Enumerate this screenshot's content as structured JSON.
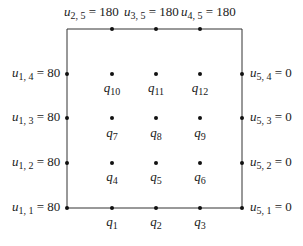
{
  "diagram": {
    "type": "finite-difference-grid",
    "colors": {
      "line": "#333333",
      "node": "#111111",
      "text": "#1a1a1a",
      "background": "#ffffff"
    },
    "boundary": {
      "top": [
        {
          "var": "u",
          "sub": "2, 5",
          "eq": " = 180"
        },
        {
          "var": "u",
          "sub": "3, 5",
          "eq": " = 180"
        },
        {
          "var": "u",
          "sub": "4, 5",
          "eq": " = 180"
        }
      ],
      "left": [
        {
          "var": "u",
          "sub": "1, 4",
          "eq": " = 80"
        },
        {
          "var": "u",
          "sub": "1, 3",
          "eq": " = 80"
        },
        {
          "var": "u",
          "sub": "1, 2",
          "eq": " = 80"
        },
        {
          "var": "u",
          "sub": "1, 1",
          "eq": " = 80"
        }
      ],
      "right": [
        {
          "var": "u",
          "sub": "5, 4",
          "eq": " = 0"
        },
        {
          "var": "u",
          "sub": "5, 3",
          "eq": " = 0"
        },
        {
          "var": "u",
          "sub": "5, 2",
          "eq": " = 0"
        },
        {
          "var": "u",
          "sub": "5, 1",
          "eq": " = 0"
        }
      ]
    },
    "interior": [
      {
        "var": "q",
        "sub": "10"
      },
      {
        "var": "q",
        "sub": "11"
      },
      {
        "var": "q",
        "sub": "12"
      },
      {
        "var": "q",
        "sub": "7"
      },
      {
        "var": "q",
        "sub": "8"
      },
      {
        "var": "q",
        "sub": "9"
      },
      {
        "var": "q",
        "sub": "4"
      },
      {
        "var": "q",
        "sub": "5"
      },
      {
        "var": "q",
        "sub": "6"
      },
      {
        "var": "q",
        "sub": "1"
      },
      {
        "var": "q",
        "sub": "2"
      },
      {
        "var": "q",
        "sub": "3"
      }
    ]
  }
}
